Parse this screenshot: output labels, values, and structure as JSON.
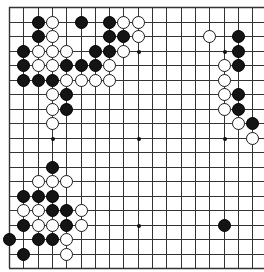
{
  "board": {
    "size": 19,
    "visible_columns": 18,
    "visible_rows": 19,
    "cropped_right": true,
    "line_color": "#333333",
    "background": "#ffffff",
    "origin_x": 9,
    "origin_y": 7,
    "spacing_x": 14.3,
    "spacing_y": 14.5,
    "stone_diameter": 13,
    "star_points": [
      [
        3,
        3
      ],
      [
        9,
        3
      ],
      [
        15,
        3
      ],
      [
        3,
        9
      ],
      [
        9,
        9
      ],
      [
        15,
        9
      ],
      [
        3,
        15
      ],
      [
        9,
        15
      ],
      [
        15,
        15
      ]
    ],
    "stones": {
      "black": [
        [
          2,
          1
        ],
        [
          5,
          1
        ],
        [
          7,
          1
        ],
        [
          2,
          2
        ],
        [
          7,
          2
        ],
        [
          8,
          2
        ],
        [
          16,
          2
        ],
        [
          1,
          3
        ],
        [
          6,
          3
        ],
        [
          7,
          3
        ],
        [
          16,
          3
        ],
        [
          1,
          4
        ],
        [
          4,
          4
        ],
        [
          5,
          4
        ],
        [
          6,
          4
        ],
        [
          16,
          4
        ],
        [
          1,
          5
        ],
        [
          2,
          5
        ],
        [
          3,
          5
        ],
        [
          4,
          6
        ],
        [
          16,
          6
        ],
        [
          4,
          7
        ],
        [
          16,
          7
        ],
        [
          17,
          8
        ],
        [
          3,
          11
        ],
        [
          1,
          13
        ],
        [
          2,
          13
        ],
        [
          3,
          13
        ],
        [
          3,
          14
        ],
        [
          4,
          14
        ],
        [
          1,
          15
        ],
        [
          4,
          15
        ],
        [
          15,
          15
        ],
        [
          0,
          16
        ],
        [
          2,
          16
        ],
        [
          3,
          16
        ],
        [
          1,
          17
        ]
      ],
      "white": [
        [
          3,
          1
        ],
        [
          8,
          1
        ],
        [
          9,
          1
        ],
        [
          3,
          2
        ],
        [
          9,
          2
        ],
        [
          14,
          2
        ],
        [
          2,
          3
        ],
        [
          3,
          3
        ],
        [
          4,
          3
        ],
        [
          8,
          3
        ],
        [
          2,
          4
        ],
        [
          3,
          4
        ],
        [
          7,
          4
        ],
        [
          15,
          4
        ],
        [
          4,
          5
        ],
        [
          5,
          5
        ],
        [
          6,
          5
        ],
        [
          7,
          5
        ],
        [
          15,
          5
        ],
        [
          3,
          6
        ],
        [
          15,
          6
        ],
        [
          3,
          7
        ],
        [
          15,
          7
        ],
        [
          3,
          8
        ],
        [
          16,
          8
        ],
        [
          17,
          9
        ],
        [
          2,
          12
        ],
        [
          3,
          12
        ],
        [
          4,
          12
        ],
        [
          1,
          14
        ],
        [
          2,
          14
        ],
        [
          5,
          14
        ],
        [
          2,
          15
        ],
        [
          3,
          15
        ],
        [
          5,
          15
        ],
        [
          4,
          16
        ],
        [
          4,
          17
        ]
      ]
    }
  }
}
